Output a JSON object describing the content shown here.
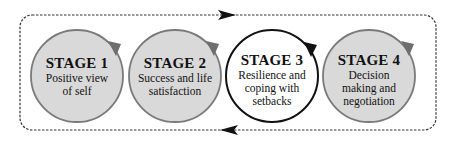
{
  "diagram": {
    "type": "cyclic stage process",
    "colors": {
      "background": "#ffffff",
      "border_dashed": "#333333",
      "arrow": "#111111",
      "circle_fill_gray": "#d9d9d9",
      "circle_stroke_gray": "#7a7a7a",
      "circle_fill_highlight": "#ffffff",
      "circle_stroke_highlight": "#111111"
    },
    "flow": {
      "top_arrow_direction": "right",
      "bottom_arrow_direction": "left"
    },
    "stages": [
      {
        "title": "STAGE 1",
        "lines": [
          "Positive view",
          "of self"
        ],
        "highlighted": false
      },
      {
        "title": "STAGE 2",
        "lines": [
          "Success and life",
          "satisfaction"
        ],
        "highlighted": false
      },
      {
        "title": "STAGE 3",
        "lines": [
          "Resilience and",
          "coping with",
          "setbacks"
        ],
        "highlighted": true
      },
      {
        "title": "STAGE 4",
        "lines": [
          "Decision",
          "making and",
          "negotiation"
        ],
        "highlighted": false
      }
    ]
  }
}
